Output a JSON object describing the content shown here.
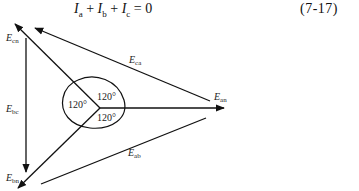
{
  "equation": {
    "terms": [
      {
        "symbol": "I",
        "sub": "a"
      },
      {
        "symbol": "I",
        "sub": "b"
      },
      {
        "symbol": "I",
        "sub": "c"
      }
    ],
    "op1": "+",
    "op2": "+",
    "rhs": "= 0",
    "number": "(7-17)"
  },
  "diagram": {
    "phasors": [
      {
        "name": "E_an",
        "symbol": "E",
        "sub": "an"
      },
      {
        "name": "E_bn",
        "symbol": "E",
        "sub": "bn"
      },
      {
        "name": "E_cn",
        "symbol": "E",
        "sub": "cn"
      }
    ],
    "line_voltages": [
      {
        "name": "E_ab",
        "symbol": "E",
        "sub": "ab"
      },
      {
        "name": "E_bc",
        "symbol": "E",
        "sub": "bc"
      },
      {
        "name": "E_ca",
        "symbol": "E",
        "sub": "ca"
      }
    ],
    "angles": [
      "120°",
      "120°",
      "120°"
    ]
  }
}
